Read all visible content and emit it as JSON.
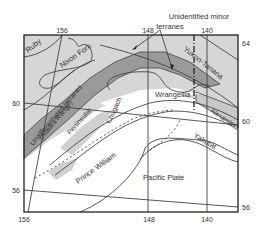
{
  "map": {
    "title_annotation": {
      "line1": "Unidentified minor",
      "line2": "terranes"
    },
    "terranes": {
      "ruby": "Ruby",
      "nixon_fork": "Nixon Fork",
      "yukon_tanana": "Yukon-Tanana",
      "wrangellia": "Wrangellia",
      "undiff_line1": "Undifferentiated terranes",
      "undiff_line2": "(Alaska Range)",
      "peninsular": "Peninsular",
      "chugach": "Chugach",
      "alexander": "Alexander",
      "prince_william": "Prince William",
      "yakutat": "Yakutat",
      "pacific_plate": "Pacific Plate"
    },
    "longitude_ticks_top": [
      "156",
      "148",
      "140"
    ],
    "longitude_ticks_bottom": [
      "156",
      "148",
      "140"
    ],
    "latitude_ticks_left": [
      "60",
      "56"
    ],
    "latitude_ticks_right": [
      "64",
      "60",
      "56"
    ],
    "colors": {
      "light_fill": "#d6d6d6",
      "dark_fill": "#9a9a9a",
      "line": "#444444",
      "frame": "#222222",
      "background": "#ffffff"
    }
  }
}
